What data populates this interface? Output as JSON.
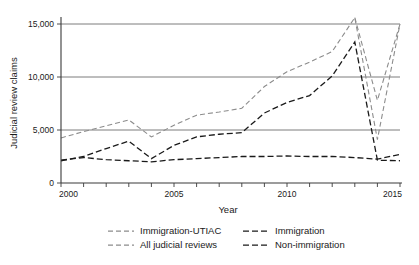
{
  "chart_data": {
    "type": "line",
    "title": "",
    "xlabel": "Year",
    "ylabel": "Judicial review claims",
    "xlim": [
      2000,
      2015
    ],
    "ylim": [
      0,
      16200
    ],
    "grid": "horizontal",
    "legend_position": "bottom",
    "x": [
      2000,
      2001,
      2002,
      2003,
      2004,
      2005,
      2006,
      2007,
      2008,
      2009,
      2010,
      2011,
      2012,
      2013,
      2014,
      2015
    ],
    "x_tick_labels": [
      "2000",
      "2005",
      "2010",
      "2015"
    ],
    "x_tick_values": [
      2000,
      2005,
      2010,
      2015
    ],
    "y_tick_labels": [
      "0",
      "5,000",
      "10,000",
      "15,000"
    ],
    "y_tick_values": [
      0,
      5000,
      10000,
      15000
    ],
    "series": [
      {
        "name": "Immigration-UTIAC",
        "color": "#8c8c8c",
        "dash": "5,3",
        "width": 1.1,
        "values": [
          null,
          null,
          null,
          null,
          null,
          null,
          null,
          null,
          null,
          null,
          null,
          null,
          null,
          15600,
          7800,
          15000
        ]
      },
      {
        "name": "All judicial reviews",
        "color": "#8c8c8c",
        "dash": "5,3",
        "width": 1.1,
        "values": [
          4250,
          4850,
          5400,
          5950,
          4350,
          5450,
          6400,
          6700,
          7050,
          9100,
          10500,
          11400,
          12400,
          15600,
          4100,
          15000
        ]
      },
      {
        "name": "Immigration",
        "color": "#1a1a1a",
        "dash": "6,3",
        "width": 1.3,
        "values": [
          2100,
          2500,
          3250,
          3950,
          2300,
          3550,
          4350,
          4600,
          4750,
          6600,
          7600,
          8250,
          10100,
          13300,
          2150,
          2100
        ]
      },
      {
        "name": "Non-immigration",
        "color": "#1a1a1a",
        "dash": "6,3",
        "width": 1.3,
        "values": [
          2150,
          2400,
          2200,
          2100,
          2000,
          2200,
          2300,
          2400,
          2500,
          2500,
          2550,
          2500,
          2500,
          2400,
          2250,
          2700
        ]
      }
    ],
    "legend": [
      {
        "label": "Immigration-UTIAC",
        "color": "#8c8c8c",
        "dash": "5,3"
      },
      {
        "label": "Immigration",
        "color": "#1a1a1a",
        "dash": "6,3"
      },
      {
        "label": "All judicial reviews",
        "color": "#8c8c8c",
        "dash": "5,3"
      },
      {
        "label": "Non-immigration",
        "color": "#1a1a1a",
        "dash": "6,3"
      }
    ]
  }
}
